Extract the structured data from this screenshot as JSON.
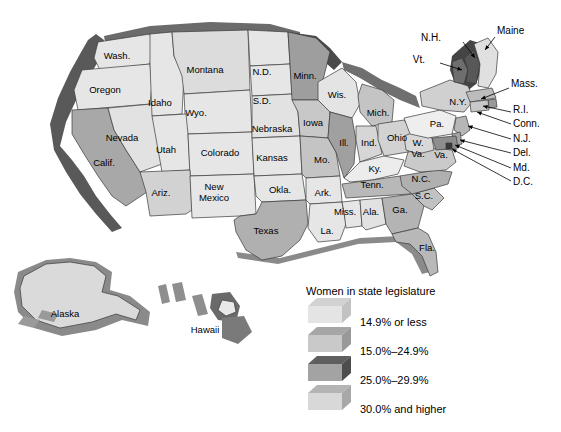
{
  "figure": {
    "type": "choropleth-map",
    "subject": "Women in state legislature",
    "background_color": "#ffffff",
    "style": "3D extruded grayscale US map with Alaska and Hawaii insets"
  },
  "legend": {
    "title": "Women in state legislature",
    "entries": [
      {
        "label": "14.9% or less",
        "front_color": "#e4e4e4",
        "top_color": "#d2d2d2",
        "side_color": "#c2c2c2"
      },
      {
        "label": "15.0%–24.9%",
        "front_color": "#c9c9c9",
        "top_color": "#a6a6a6",
        "side_color": "#999999"
      },
      {
        "label": "25.0%–29.9%",
        "front_color": "#a3a3a3",
        "top_color": "#5e5e5e",
        "side_color": "#4d4d4d"
      },
      {
        "label": "30.0% and higher",
        "front_color": "#d8d8d8",
        "top_color": "#b4b4b4",
        "side_color": "#a8a8a8"
      }
    ]
  },
  "colors": {
    "cat1_fill": "#e6e6e6",
    "cat2_fill": "#c2c2c2",
    "cat3_fill": "#8f8f8f",
    "cat4_fill": "#d4d4d4",
    "extrude_dark": "#595959",
    "extrude_mid": "#8a8a8a",
    "border": "#3a3a3a",
    "text": "#000000"
  },
  "map": {
    "inline_labels": [
      {
        "name": "Wash.",
        "x": 117,
        "y": 56,
        "size": "normal"
      },
      {
        "name": "Oregon",
        "x": 105,
        "y": 90,
        "size": "normal"
      },
      {
        "name": "Idaho",
        "x": 160,
        "y": 103,
        "size": "normal"
      },
      {
        "name": "Montana",
        "x": 205,
        "y": 70,
        "size": "normal"
      },
      {
        "name": "N.D.",
        "x": 262,
        "y": 72,
        "size": "normal"
      },
      {
        "name": "S.D.",
        "x": 262,
        "y": 101,
        "size": "normal"
      },
      {
        "name": "Minn.",
        "x": 305,
        "y": 76,
        "size": "normal"
      },
      {
        "name": "Wis.",
        "x": 337,
        "y": 95,
        "size": "normal"
      },
      {
        "name": "Mich.",
        "x": 378,
        "y": 113,
        "size": "normal"
      },
      {
        "name": "Wyo.",
        "x": 196,
        "y": 113,
        "size": "normal"
      },
      {
        "name": "Nevada",
        "x": 122,
        "y": 138,
        "size": "normal"
      },
      {
        "name": "Calif.",
        "x": 104,
        "y": 163,
        "size": "normal"
      },
      {
        "name": "Utah",
        "x": 166,
        "y": 150,
        "size": "normal"
      },
      {
        "name": "Colorado",
        "x": 220,
        "y": 153,
        "size": "normal"
      },
      {
        "name": "Nebraska",
        "x": 272,
        "y": 129,
        "size": "normal"
      },
      {
        "name": "Iowa",
        "x": 313,
        "y": 123,
        "size": "normal"
      },
      {
        "name": "Ill.",
        "x": 344,
        "y": 143,
        "size": "normal"
      },
      {
        "name": "Ind.",
        "x": 369,
        "y": 143,
        "size": "normal"
      },
      {
        "name": "Ohio",
        "x": 397,
        "y": 138,
        "size": "normal"
      },
      {
        "name": "Kansas",
        "x": 272,
        "y": 158,
        "size": "normal"
      },
      {
        "name": "Mo.",
        "x": 322,
        "y": 160,
        "size": "normal"
      },
      {
        "name": "Ky.",
        "x": 375,
        "y": 169,
        "size": "normal"
      },
      {
        "name": "Ariz.",
        "x": 161,
        "y": 193,
        "size": "normal"
      },
      {
        "name": "Okla.",
        "x": 280,
        "y": 190,
        "size": "normal"
      },
      {
        "name": "Ark.",
        "x": 323,
        "y": 193,
        "size": "normal"
      },
      {
        "name": "Tenn.",
        "x": 372,
        "y": 185,
        "size": "normal"
      },
      {
        "name": "N.C.",
        "x": 421,
        "y": 179,
        "size": "normal"
      },
      {
        "name": "S.C.",
        "x": 424,
        "y": 196,
        "size": "normal"
      },
      {
        "name": "Texas",
        "x": 266,
        "y": 231,
        "size": "normal"
      },
      {
        "name": "Miss.",
        "x": 345,
        "y": 212,
        "size": "normal"
      },
      {
        "name": "Ala.",
        "x": 371,
        "y": 212,
        "size": "normal"
      },
      {
        "name": "Ga.",
        "x": 400,
        "y": 210,
        "size": "normal"
      },
      {
        "name": "La.",
        "x": 327,
        "y": 231,
        "size": "normal"
      },
      {
        "name": "Fla.",
        "x": 427,
        "y": 248,
        "size": "normal"
      },
      {
        "name": "N.Y.",
        "x": 458,
        "y": 102,
        "size": "normal"
      },
      {
        "name": "Pa.",
        "x": 437,
        "y": 124,
        "size": "normal"
      },
      {
        "name": "Alaska",
        "x": 65,
        "y": 314,
        "size": "normal"
      },
      {
        "name": "Hawaii",
        "x": 205,
        "y": 330,
        "size": "normal"
      }
    ],
    "stacked_labels": [
      {
        "line1": "New",
        "line2": "Mexico",
        "x": 214,
        "y": 192
      },
      {
        "line1": "W.",
        "line2": "Va.",
        "x": 418,
        "y": 148
      }
    ],
    "virginia_label": {
      "name": "Va.",
      "x": 441,
      "y": 155
    },
    "callouts": [
      {
        "name": "N.H.",
        "tx": 441,
        "ty": 38,
        "lx1": 463,
        "ly1": 42,
        "lx2": 475,
        "ly2": 58
      },
      {
        "name": "Maine",
        "tx": 497,
        "ty": 31,
        "lx1": 495,
        "ly1": 37,
        "lx2": 485,
        "ly2": 50
      },
      {
        "name": "Vt.",
        "tx": 425,
        "ty": 60,
        "lx1": 440,
        "ly1": 63,
        "lx2": 462,
        "ly2": 70
      },
      {
        "name": "Mass.",
        "tx": 511,
        "ty": 84,
        "lx1": 509,
        "ly1": 88,
        "lx2": 481,
        "ly2": 99
      },
      {
        "name": "R.I.",
        "tx": 513,
        "ty": 110,
        "lx1": 511,
        "ly1": 112,
        "lx2": 483,
        "ly2": 106
      },
      {
        "name": "Conn.",
        "tx": 513,
        "ty": 124,
        "lx1": 511,
        "ly1": 124,
        "lx2": 477,
        "ly2": 112
      },
      {
        "name": "N.J.",
        "tx": 513,
        "ty": 139,
        "lx1": 511,
        "ly1": 139,
        "lx2": 468,
        "ly2": 126
      },
      {
        "name": "Del.",
        "tx": 513,
        "ty": 153,
        "lx1": 511,
        "ly1": 153,
        "lx2": 460,
        "ly2": 140
      },
      {
        "name": "Md.",
        "tx": 513,
        "ty": 168,
        "lx1": 511,
        "ly1": 168,
        "lx2": 455,
        "ly2": 145
      },
      {
        "name": "D.C.",
        "tx": 513,
        "ty": 182,
        "lx1": 511,
        "ly1": 181,
        "lx2": 452,
        "ly2": 149
      }
    ]
  }
}
